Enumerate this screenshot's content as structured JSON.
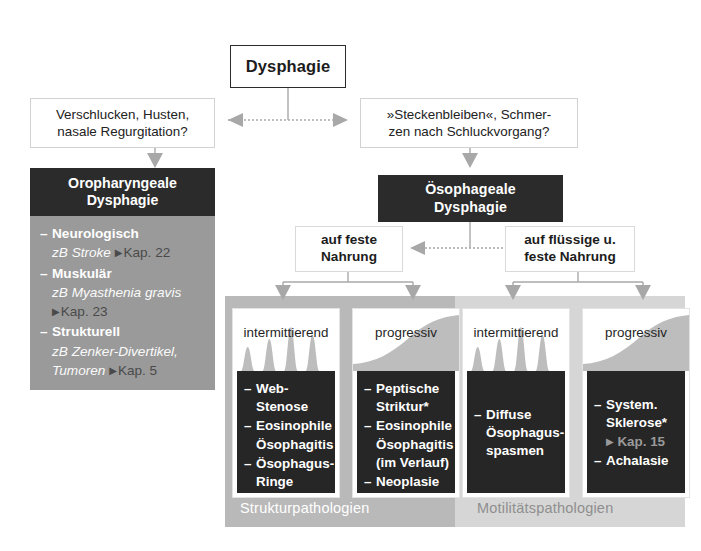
{
  "diagram": {
    "title": "Dysphagie",
    "root": {
      "label": "Dysphagie"
    },
    "questions": {
      "left": {
        "line1": "Verschlucken, Husten,",
        "line2": "nasale Regurgitation?"
      },
      "right": {
        "line1": "»Steckenbleiben«, Schmer-",
        "line2": "zen nach Schluckvorgang?"
      }
    },
    "oropharyngeal": {
      "header_line1": "Oropharyngeale",
      "header_line2": "Dysphagie",
      "items": [
        {
          "dash": "–",
          "term": "Neurologisch",
          "eg": "zB Stroke",
          "ref_tri": "▶",
          "ref": "Kap. 22"
        },
        {
          "dash": "–",
          "term": "Muskulär",
          "eg": "zB Myasthenia gravis",
          "ref_tri": "▶",
          "ref": "Kap. 23"
        },
        {
          "dash": "–",
          "term": "Strukturell",
          "eg": "zB Zenker-Divertikel, Tumoren",
          "ref_tri": "▶",
          "ref": "Kap. 5"
        }
      ]
    },
    "esophageal": {
      "header_line1": "Ösophageale",
      "header_line2": "Dysphagie"
    },
    "branches": {
      "solid": {
        "line1": "auf feste",
        "line2": "Nahrung"
      },
      "liquid": {
        "line1": "auf flüssige u.",
        "line2": "feste Nahrung"
      }
    },
    "columns": [
      {
        "title": "intermittierend",
        "graph": "spikes",
        "items": [
          {
            "dash": "–",
            "text": "Web-Stenose"
          },
          {
            "dash": "–",
            "text": "Eosinophile Ösophagitis"
          },
          {
            "dash": "–",
            "text": "Ösophagus-Ringe"
          }
        ]
      },
      {
        "title": "progressiv",
        "graph": "ramp",
        "items": [
          {
            "dash": "–",
            "text": "Peptische Striktur*"
          },
          {
            "dash": "–",
            "text": "Eosinophile Ösophagitis (im Verlauf)"
          },
          {
            "dash": "–",
            "text": "Neoplasie"
          }
        ]
      },
      {
        "title": "intermittierend",
        "graph": "spikes",
        "items": [
          {
            "dash": "–",
            "text": "Diffuse Ösophagus-spasmen"
          }
        ]
      },
      {
        "title": "progressiv",
        "graph": "ramp",
        "items": [
          {
            "dash": "–",
            "text": "System. Sklerose*",
            "sub_tri": "▶",
            "sub": "Kap. 15"
          },
          {
            "dash": "–",
            "text": "Achalasie"
          }
        ]
      }
    ],
    "footers": {
      "structural": "Strukturpathologien",
      "motility": "Motilitätspathologien"
    },
    "colors": {
      "dark_box": "#2b2b2b",
      "panel_left": "#9a9a9a",
      "panel_structural": "#b9b9b9",
      "panel_motility": "#d6d6d6",
      "card_body": "#262626",
      "connector": "#a8a8a8",
      "graph_fill": "#bdbdbd"
    }
  }
}
